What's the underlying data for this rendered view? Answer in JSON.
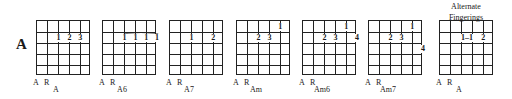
{
  "key": "A",
  "alternate_title_line1": "Alternate",
  "alternate_title_line2": "Fingerings",
  "string_labels": {
    "a": "A",
    "r": "R"
  },
  "chords": [
    {
      "name": "A",
      "left": 36,
      "fingers": [
        {
          "label": "1",
          "string": 2,
          "fret": 2
        },
        {
          "label": "2",
          "string": 3,
          "fret": 2
        },
        {
          "label": "3",
          "string": 4,
          "fret": 2
        }
      ]
    },
    {
      "name": "A6",
      "left": 102,
      "barre": {
        "fret": 2,
        "from": 2,
        "to": 5
      },
      "fingers": [
        {
          "label": "1",
          "string": 2,
          "fret": 2
        },
        {
          "label": "1",
          "string": 3,
          "fret": 2
        },
        {
          "label": "1",
          "string": 4,
          "fret": 2
        },
        {
          "label": "1",
          "string": 5,
          "fret": 2
        }
      ]
    },
    {
      "name": "A7",
      "left": 169,
      "fingers": [
        {
          "label": "1",
          "string": 2,
          "fret": 2
        },
        {
          "label": "2",
          "string": 4,
          "fret": 2
        }
      ]
    },
    {
      "name": "Am",
      "left": 236,
      "fingers": [
        {
          "label": "1",
          "string": 4,
          "fret": 1
        },
        {
          "label": "2",
          "string": 2,
          "fret": 2
        },
        {
          "label": "3",
          "string": 3,
          "fret": 2
        }
      ]
    },
    {
      "name": "Am6",
      "left": 302,
      "fingers": [
        {
          "label": "1",
          "string": 4,
          "fret": 1
        },
        {
          "label": "2",
          "string": 2,
          "fret": 2
        },
        {
          "label": "3",
          "string": 3,
          "fret": 2
        },
        {
          "label": "4",
          "string": 5,
          "fret": 2
        }
      ]
    },
    {
      "name": "Am7",
      "left": 368,
      "fingers": [
        {
          "label": "1",
          "string": 4,
          "fret": 1
        },
        {
          "label": "2",
          "string": 2,
          "fret": 2
        },
        {
          "label": "3",
          "string": 3,
          "fret": 2
        },
        {
          "label": "4",
          "string": 5,
          "fret": 3
        }
      ]
    },
    {
      "name": "A",
      "left": 439,
      "fingers": [
        {
          "label": "1–1",
          "string": 2.5,
          "fret": 2
        },
        {
          "label": "2",
          "string": 4,
          "fret": 2
        }
      ]
    }
  ]
}
